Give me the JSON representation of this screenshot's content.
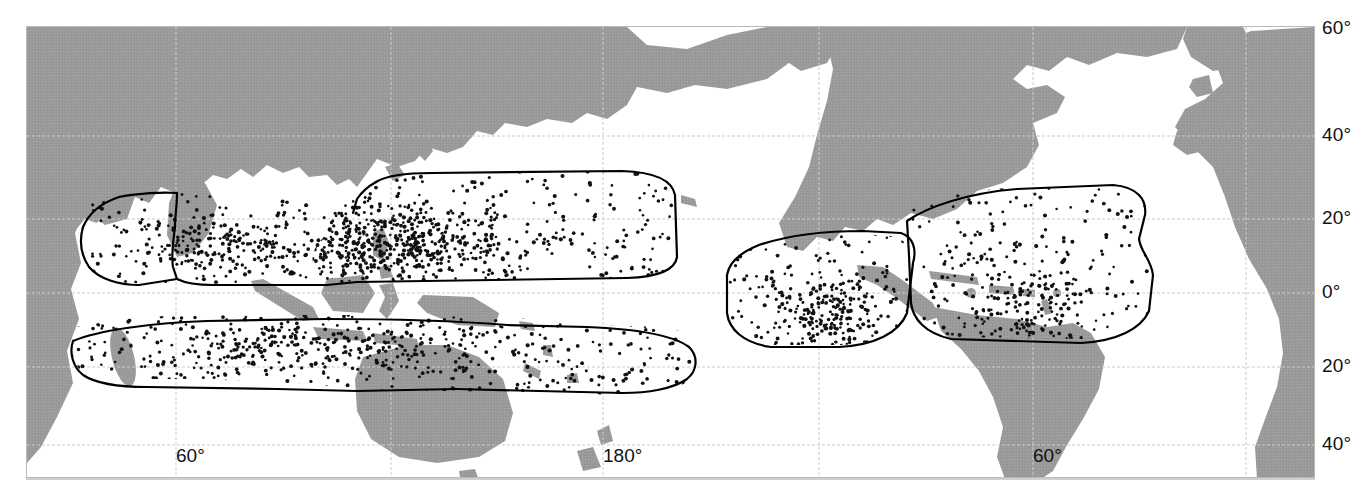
{
  "figure": {
    "type": "distribution-map",
    "projection": "cylindrical-equidistant",
    "center_longitude": 180,
    "background_color": "#ffffff",
    "land_color": "#9a9a9a",
    "ocean_color": "#ffffff",
    "range_outline_color": "#000000",
    "occurrence_dot_color": "#000000",
    "graticule_color": "#cccccc",
    "frame_color": "#b9b9b9"
  },
  "axes": {
    "latitude": {
      "unit": "degrees",
      "labels": [
        "60°",
        "40°",
        "20°",
        "0°",
        "20°",
        "40°"
      ],
      "values": [
        60,
        40,
        20,
        0,
        -20,
        -40
      ],
      "y_pixels": [
        27,
        135,
        218,
        292,
        366,
        444
      ]
    },
    "longitude": {
      "unit": "degrees",
      "labels": [
        "60°",
        "180°",
        "60°"
      ],
      "values": [
        60,
        180,
        -60
      ],
      "label_x_pixels": [
        175,
        602,
        1032
      ],
      "gridline_x_pixels": [
        175,
        390,
        602,
        818,
        1032,
        1245
      ]
    }
  },
  "chart_data": {
    "type": "scatter",
    "title": "",
    "xlabel": "",
    "ylabel": "",
    "xlim": [
      -30,
      330
    ],
    "ylim": [
      -48,
      62
    ],
    "grid": true,
    "legend": "none",
    "series": [
      {
        "name": "Indo-West Pacific northern range",
        "outline_label": "northern-indo-pacific-range",
        "dot_count_estimate": 620,
        "density": "high",
        "latitude_extent": [
          0,
          28
        ],
        "longitude_extent": [
          40,
          185
        ]
      },
      {
        "name": "Indo-West Pacific southern range",
        "outline_label": "southern-indo-pacific-range",
        "dot_count_estimate": 460,
        "density": "medium-high",
        "latitude_extent": [
          -30,
          -2
        ],
        "longitude_extent": [
          35,
          200
        ]
      },
      {
        "name": "Eastern Pacific range",
        "outline_label": "eastern-pacific-range",
        "dot_count_estimate": 280,
        "density": "medium-high",
        "latitude_extent": [
          -3,
          22
        ],
        "longitude_extent": [
          -125,
          -78
        ]
      },
      {
        "name": "Western Atlantic / Caribbean range",
        "outline_label": "western-atlantic-range",
        "dot_count_estimate": 300,
        "density": "medium",
        "latitude_extent": [
          -2,
          30
        ],
        "longitude_extent": [
          -98,
          -38
        ]
      }
    ]
  }
}
